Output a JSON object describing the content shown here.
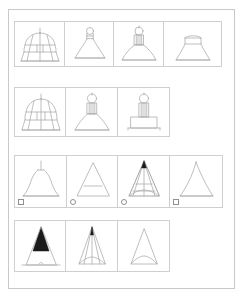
{
  "figure": {
    "title": "",
    "background_color": "#ffffff",
    "frame_color": "#c9c9c9",
    "cell_border_color": "#cfcfcf",
    "stroke_color": "#a8a8a8",
    "fill_color": "#1a1a1a",
    "rows": [
      {
        "id": "row-1",
        "cell_count": 4,
        "cells": [
          {
            "name": "pagoda-bell-outline",
            "shape": "tiered-bell-with-finial",
            "filled": false,
            "marker": null
          },
          {
            "name": "flask-bell-outline",
            "shape": "narrow-neck-flask-with-knob",
            "filled": false,
            "marker": null
          },
          {
            "name": "dome-lamp-outline",
            "shape": "ribbed-stem-dome-lamp",
            "filled": false,
            "marker": null
          },
          {
            "name": "trapezoid-bell-outline",
            "shape": "flared-trapezoid-bell",
            "filled": false,
            "marker": null
          }
        ]
      },
      {
        "id": "row-2",
        "cell_count": 3,
        "cells": [
          {
            "name": "pagoda-bell-outline",
            "shape": "tiered-bell-with-finial",
            "filled": false,
            "marker": null
          },
          {
            "name": "ribbed-lamp-outline",
            "shape": "ribbed-stem-flared-lamp",
            "filled": false,
            "marker": null
          },
          {
            "name": "pedestal-lamp-outline",
            "shape": "ribbed-stem-on-rectangular-pedestal",
            "filled": false,
            "marker": null
          }
        ]
      },
      {
        "id": "row-3",
        "cell_count": 4,
        "cells": [
          {
            "name": "spire-dome-outline",
            "shape": "rounded-dome-with-spire",
            "filled": false,
            "marker": "square"
          },
          {
            "name": "triangle-with-crossbar",
            "shape": "triangle-with-horizontal-band",
            "filled": false,
            "marker": "circle"
          },
          {
            "name": "nested-triangle-outline",
            "shape": "layered-nested-triangles",
            "filled": false,
            "marker": "circle"
          },
          {
            "name": "plain-triangle-outline",
            "shape": "concave-sided-triangle",
            "filled": false,
            "marker": "square"
          }
        ]
      },
      {
        "id": "row-4",
        "cell_count": 3,
        "cells": [
          {
            "name": "filled-spire-triangle",
            "shape": "solid-black-spire-over-open-triangle",
            "filled": true,
            "marker": null
          },
          {
            "name": "fanned-triangle-outline",
            "shape": "narrow-triangle-with-internal-fan-lines",
            "filled": false,
            "marker": null
          },
          {
            "name": "arched-base-triangle",
            "shape": "narrow-triangle-with-arched-base",
            "filled": false,
            "marker": null
          }
        ]
      }
    ],
    "markers": {
      "square_label": "square",
      "circle_label": "circle"
    }
  }
}
